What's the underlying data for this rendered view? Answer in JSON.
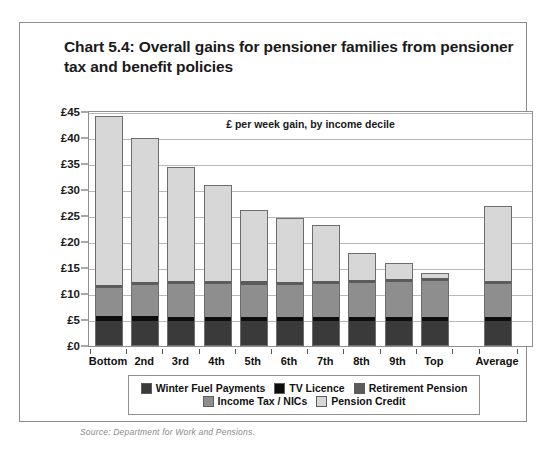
{
  "title": "Chart 5.4: Overall gains for pensioner families from pensioner tax and benefit policies",
  "source": "Source: Department for Work and Pensions.",
  "legend": {
    "items": [
      {
        "label": "Winter Fuel Payments",
        "color": "#3a3a3a",
        "key": "winter-fuel-payments"
      },
      {
        "label": "TV Licence",
        "color": "#0d0d0d",
        "key": "tv-licence"
      },
      {
        "label": "Retirement Pension",
        "color": "#5b5b5b",
        "key": "retirement-pension"
      },
      {
        "label": "Income Tax / NICs",
        "color": "#8e8e8e",
        "key": "income-tax-nics"
      },
      {
        "label": "Pension Credit",
        "color": "#d7d7d7",
        "key": "pension-credit"
      }
    ]
  },
  "chart_data": {
    "type": "bar",
    "stacked": true,
    "title": "Chart 5.4: Overall gains for pensioner families from pensioner tax and benefit policies",
    "subtitle": "£ per week gain, by income decile",
    "xlabel": "",
    "ylabel": "",
    "ylim": [
      0,
      45
    ],
    "ytick_step": 5,
    "ytick_labels": [
      "£0",
      "£5",
      "£10",
      "£15",
      "£20",
      "£25",
      "£30",
      "£35",
      "£40",
      "£45"
    ],
    "ytick_values": [
      0,
      5,
      10,
      15,
      20,
      25,
      30,
      35,
      40,
      45
    ],
    "grid": true,
    "legend_position": "bottom",
    "categories": [
      "Bottom",
      "2nd",
      "3rd",
      "4th",
      "5th",
      "6th",
      "7th",
      "8th",
      "9th",
      "Top",
      "Average"
    ],
    "separator_before": "Average",
    "series": [
      {
        "name": "Winter Fuel Payments",
        "color": "#3a3a3a",
        "values": [
          4.7,
          4.7,
          4.7,
          4.7,
          4.7,
          4.7,
          4.7,
          4.7,
          4.7,
          4.7,
          4.7
        ]
      },
      {
        "name": "TV Licence",
        "color": "#0d0d0d",
        "values": [
          0.9,
          0.9,
          0.8,
          0.8,
          0.8,
          0.8,
          0.8,
          0.8,
          0.8,
          0.8,
          0.8
        ]
      },
      {
        "name": "Income Tax / NICs",
        "color": "#8e8e8e",
        "values": [
          5.5,
          6.1,
          6.4,
          6.3,
          6.3,
          6.3,
          6.4,
          6.6,
          6.9,
          7.1,
          6.4
        ]
      },
      {
        "name": "Retirement Pension",
        "color": "#5b5b5b",
        "values": [
          0.5,
          0.6,
          0.6,
          0.6,
          0.6,
          0.6,
          0.6,
          0.6,
          0.6,
          0.6,
          0.6
        ]
      },
      {
        "name": "Pension Credit",
        "color": "#d7d7d7",
        "values": [
          32.7,
          27.7,
          22.0,
          18.6,
          13.8,
          12.2,
          10.8,
          5.1,
          2.9,
          0.9,
          14.5
        ]
      }
    ],
    "totals": [
      44.3,
      40.0,
      34.5,
      31.0,
      26.2,
      24.6,
      23.3,
      17.8,
      15.9,
      14.1,
      27.0
    ]
  }
}
